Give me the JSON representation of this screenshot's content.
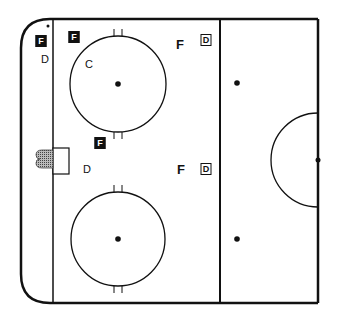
{
  "rink": {
    "line_color": "#111111",
    "background": "#ffffff"
  },
  "players": [
    {
      "label": "F",
      "style": "boxed-filled",
      "x": 41,
      "y": 41
    },
    {
      "label": "D",
      "style": "plain-thin",
      "x": 45,
      "y": 59
    },
    {
      "label": "F",
      "style": "boxed-filled",
      "x": 74,
      "y": 37
    },
    {
      "label": "C",
      "style": "plain-thin",
      "x": 89,
      "y": 64
    },
    {
      "label": "F",
      "style": "plain",
      "x": 180,
      "y": 44
    },
    {
      "label": "D",
      "style": "boxed-outline",
      "x": 206,
      "y": 40
    },
    {
      "label": "F",
      "style": "boxed-filled",
      "x": 100,
      "y": 143
    },
    {
      "label": "D",
      "style": "plain-thin",
      "x": 87,
      "y": 169
    },
    {
      "label": "F",
      "style": "plain",
      "x": 181,
      "y": 169
    },
    {
      "label": "D",
      "style": "boxed-outline",
      "x": 206,
      "y": 169
    }
  ]
}
